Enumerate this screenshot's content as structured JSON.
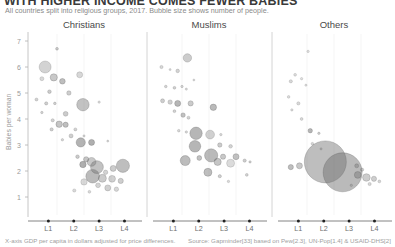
{
  "header": {
    "title": "WITH HIGHER INCOME COMES FEWER BABIES",
    "subtitle": "All countries split into religious groups, 2017. Bubble size shows number of people."
  },
  "footer": {
    "note": "X-axis GDP per capita in dollars adjusted for price differences.",
    "source": "Source: Gapminder[33] based on Pew[2.3], UN-Pop[1.4] & USAID-DHS[2]"
  },
  "axes": {
    "ylabel": "Babies per woman",
    "yticks": [
      "7",
      "6",
      "5",
      "4",
      "3",
      "2",
      "1"
    ],
    "xticks": [
      "L1",
      "L2",
      "L3",
      "L4"
    ]
  },
  "chart_data": {
    "type": "scatter",
    "title": "WITH HIGHER INCOME COMES FEWER BABIES",
    "subtitle": "All countries split into religious groups, 2017. Bubble size shows number of people.",
    "xlabel": "X-axis GDP per capita in dollars adjusted for price differences.",
    "ylabel": "Babies per woman",
    "xscale": "log",
    "xtick_labels": [
      "L1",
      "L2",
      "L3",
      "L4"
    ],
    "ytick_labels": [
      "7",
      "6",
      "5",
      "4",
      "3",
      "2",
      "1"
    ],
    "ylim": [
      0.7,
      7.4
    ],
    "grid": false,
    "legend": "none",
    "size_encoding": "bubble area = number of people",
    "panels": [
      {
        "name": "Christians",
        "points": [
          {
            "x": 0.14,
            "y": 6.0,
            "r": 6.0,
            "o": 0.3
          },
          {
            "x": 0.25,
            "y": 6.7,
            "r": 1.4,
            "o": 0.35
          },
          {
            "x": 0.22,
            "y": 5.6,
            "r": 3.6,
            "o": 0.38
          },
          {
            "x": 0.3,
            "y": 5.45,
            "r": 2.8,
            "o": 0.45
          },
          {
            "x": 0.46,
            "y": 5.7,
            "r": 3.0,
            "o": 0.28
          },
          {
            "x": 0.11,
            "y": 5.55,
            "r": 2.0,
            "o": 0.26
          },
          {
            "x": 0.18,
            "y": 5.05,
            "r": 1.8,
            "o": 0.35
          },
          {
            "x": 0.36,
            "y": 5.0,
            "r": 2.2,
            "o": 0.34
          },
          {
            "x": 0.06,
            "y": 4.75,
            "r": 1.5,
            "o": 0.3
          },
          {
            "x": 0.15,
            "y": 4.6,
            "r": 1.6,
            "o": 0.33
          },
          {
            "x": 0.23,
            "y": 4.6,
            "r": 1.3,
            "o": 0.32
          },
          {
            "x": 0.49,
            "y": 4.55,
            "r": 6.2,
            "o": 0.42
          },
          {
            "x": 0.64,
            "y": 4.65,
            "r": 1.2,
            "o": 0.25
          },
          {
            "x": 0.11,
            "y": 4.25,
            "r": 1.2,
            "o": 0.3
          },
          {
            "x": 0.33,
            "y": 4.2,
            "r": 2.4,
            "o": 0.36
          },
          {
            "x": 0.21,
            "y": 3.95,
            "r": 1.6,
            "o": 0.3
          },
          {
            "x": 0.27,
            "y": 3.8,
            "r": 3.2,
            "o": 0.4
          },
          {
            "x": 0.33,
            "y": 3.78,
            "r": 2.6,
            "o": 0.44
          },
          {
            "x": 0.2,
            "y": 3.6,
            "r": 1.6,
            "o": 0.32
          },
          {
            "x": 0.42,
            "y": 3.6,
            "r": 1.5,
            "o": 0.3
          },
          {
            "x": 0.38,
            "y": 3.35,
            "r": 2.0,
            "o": 0.33
          },
          {
            "x": 0.3,
            "y": 3.2,
            "r": 1.2,
            "o": 0.28
          },
          {
            "x": 0.5,
            "y": 3.35,
            "r": 1.1,
            "o": 0.26
          },
          {
            "x": 0.47,
            "y": 3.1,
            "r": 4.6,
            "o": 0.52
          },
          {
            "x": 0.57,
            "y": 3.1,
            "r": 3.0,
            "o": 0.55
          },
          {
            "x": 0.72,
            "y": 3.15,
            "r": 1.0,
            "o": 0.28
          },
          {
            "x": 0.44,
            "y": 2.55,
            "r": 1.8,
            "o": 0.36
          },
          {
            "x": 0.52,
            "y": 2.45,
            "r": 2.6,
            "o": 0.4
          },
          {
            "x": 0.57,
            "y": 2.35,
            "r": 4.4,
            "o": 0.38
          },
          {
            "x": 0.49,
            "y": 2.25,
            "r": 3.2,
            "o": 0.55
          },
          {
            "x": 0.62,
            "y": 2.15,
            "r": 6.4,
            "o": 0.42
          },
          {
            "x": 0.86,
            "y": 2.2,
            "r": 6.6,
            "o": 0.45
          },
          {
            "x": 0.77,
            "y": 2.1,
            "r": 3.0,
            "o": 0.35
          },
          {
            "x": 0.7,
            "y": 1.95,
            "r": 2.2,
            "o": 0.3
          },
          {
            "x": 0.58,
            "y": 1.8,
            "r": 6.8,
            "o": 0.48
          },
          {
            "x": 0.67,
            "y": 1.72,
            "r": 4.0,
            "o": 0.36
          },
          {
            "x": 0.76,
            "y": 1.7,
            "r": 3.4,
            "o": 0.32
          },
          {
            "x": 0.84,
            "y": 1.62,
            "r": 2.6,
            "o": 0.34
          },
          {
            "x": 0.5,
            "y": 1.58,
            "r": 3.2,
            "o": 0.26
          },
          {
            "x": 0.63,
            "y": 1.45,
            "r": 2.4,
            "o": 0.3
          },
          {
            "x": 0.72,
            "y": 1.35,
            "r": 3.0,
            "o": 0.32
          },
          {
            "x": 0.8,
            "y": 1.3,
            "r": 2.2,
            "o": 0.28
          },
          {
            "x": 0.41,
            "y": 1.25,
            "r": 1.6,
            "o": 0.26
          },
          {
            "x": 0.55,
            "y": 1.2,
            "r": 1.4,
            "o": 0.26
          }
        ]
      },
      {
        "name": "Muslims",
        "points": [
          {
            "x": 0.3,
            "y": 6.35,
            "r": 4.2,
            "o": 0.35
          },
          {
            "x": 0.06,
            "y": 6.0,
            "r": 1.6,
            "o": 0.28
          },
          {
            "x": 0.21,
            "y": 5.85,
            "r": 1.8,
            "o": 0.3
          },
          {
            "x": 0.14,
            "y": 5.9,
            "r": 1.0,
            "o": 0.26
          },
          {
            "x": 0.36,
            "y": 5.5,
            "r": 1.0,
            "o": 0.25
          },
          {
            "x": 0.1,
            "y": 5.25,
            "r": 1.3,
            "o": 0.3
          },
          {
            "x": 0.18,
            "y": 5.2,
            "r": 1.4,
            "o": 0.32
          },
          {
            "x": 0.25,
            "y": 5.25,
            "r": 1.2,
            "o": 0.28
          },
          {
            "x": 0.29,
            "y": 5.15,
            "r": 1.1,
            "o": 0.27
          },
          {
            "x": 0.07,
            "y": 4.7,
            "r": 2.0,
            "o": 0.34
          },
          {
            "x": 0.14,
            "y": 4.65,
            "r": 2.2,
            "o": 0.32
          },
          {
            "x": 0.21,
            "y": 4.6,
            "r": 3.0,
            "o": 0.5
          },
          {
            "x": 0.33,
            "y": 4.6,
            "r": 2.6,
            "o": 0.36
          },
          {
            "x": 0.54,
            "y": 4.45,
            "r": 3.2,
            "o": 0.48
          },
          {
            "x": 0.18,
            "y": 4.3,
            "r": 1.4,
            "o": 0.3
          },
          {
            "x": 0.26,
            "y": 4.15,
            "r": 2.2,
            "o": 0.42
          },
          {
            "x": 0.31,
            "y": 4.05,
            "r": 1.5,
            "o": 0.3
          },
          {
            "x": 0.22,
            "y": 3.55,
            "r": 1.3,
            "o": 0.28
          },
          {
            "x": 0.29,
            "y": 3.5,
            "r": 1.2,
            "o": 0.27
          },
          {
            "x": 0.38,
            "y": 3.45,
            "r": 6.2,
            "o": 0.5
          },
          {
            "x": 0.51,
            "y": 3.4,
            "r": 4.4,
            "o": 0.32
          },
          {
            "x": 0.61,
            "y": 3.4,
            "r": 1.2,
            "o": 0.28
          },
          {
            "x": 0.37,
            "y": 2.95,
            "r": 5.8,
            "o": 0.5
          },
          {
            "x": 0.6,
            "y": 3.0,
            "r": 2.2,
            "o": 0.35
          },
          {
            "x": 0.7,
            "y": 2.95,
            "r": 1.8,
            "o": 0.3
          },
          {
            "x": 0.52,
            "y": 2.6,
            "r": 6.6,
            "o": 0.48
          },
          {
            "x": 0.41,
            "y": 2.5,
            "r": 2.4,
            "o": 0.42
          },
          {
            "x": 0.63,
            "y": 2.55,
            "r": 2.6,
            "o": 0.38
          },
          {
            "x": 0.75,
            "y": 2.55,
            "r": 3.0,
            "o": 0.42
          },
          {
            "x": 0.28,
            "y": 2.4,
            "r": 5.0,
            "o": 0.46
          },
          {
            "x": 0.58,
            "y": 2.35,
            "r": 3.6,
            "o": 0.4
          },
          {
            "x": 0.7,
            "y": 2.3,
            "r": 4.0,
            "o": 0.25
          },
          {
            "x": 0.83,
            "y": 2.4,
            "r": 1.6,
            "o": 0.34
          },
          {
            "x": 0.88,
            "y": 2.35,
            "r": 1.2,
            "o": 0.3
          },
          {
            "x": 0.49,
            "y": 1.95,
            "r": 4.0,
            "o": 0.45
          },
          {
            "x": 0.6,
            "y": 1.8,
            "r": 1.6,
            "o": 0.32
          },
          {
            "x": 0.85,
            "y": 1.85,
            "r": 1.4,
            "o": 0.3
          },
          {
            "x": 0.68,
            "y": 1.6,
            "r": 1.2,
            "o": 0.26
          }
        ]
      },
      {
        "name": "Others",
        "points": [
          {
            "x": 0.26,
            "y": 6.6,
            "r": 1.2,
            "o": 0.22
          },
          {
            "x": 0.14,
            "y": 5.7,
            "r": 1.4,
            "o": 0.24
          },
          {
            "x": 0.2,
            "y": 5.55,
            "r": 1.2,
            "o": 0.22
          },
          {
            "x": 0.1,
            "y": 5.45,
            "r": 1.6,
            "o": 0.26
          },
          {
            "x": 0.24,
            "y": 5.3,
            "r": 1.1,
            "o": 0.22
          },
          {
            "x": 0.08,
            "y": 4.85,
            "r": 1.3,
            "o": 0.24
          },
          {
            "x": 0.17,
            "y": 4.6,
            "r": 1.6,
            "o": 0.26
          },
          {
            "x": 0.11,
            "y": 4.35,
            "r": 1.2,
            "o": 0.24
          },
          {
            "x": 0.2,
            "y": 4.0,
            "r": 1.4,
            "o": 0.26
          },
          {
            "x": 0.28,
            "y": 3.55,
            "r": 2.2,
            "o": 0.5
          },
          {
            "x": 0.36,
            "y": 3.45,
            "r": 1.2,
            "o": 0.32
          },
          {
            "x": 0.3,
            "y": 3.05,
            "r": 1.3,
            "o": 0.28
          },
          {
            "x": 0.38,
            "y": 2.85,
            "r": 1.1,
            "o": 0.26
          },
          {
            "x": 0.42,
            "y": 2.35,
            "r": 21.0,
            "o": 0.45
          },
          {
            "x": 0.58,
            "y": 1.95,
            "r": 19.5,
            "o": 0.48
          },
          {
            "x": 0.1,
            "y": 2.15,
            "r": 2.6,
            "o": 0.45
          },
          {
            "x": 0.18,
            "y": 2.2,
            "r": 3.0,
            "o": 0.38
          },
          {
            "x": 0.71,
            "y": 2.2,
            "r": 2.0,
            "o": 0.38
          },
          {
            "x": 0.76,
            "y": 2.05,
            "r": 1.6,
            "o": 0.32
          },
          {
            "x": 0.72,
            "y": 1.85,
            "r": 3.4,
            "o": 0.4
          },
          {
            "x": 0.8,
            "y": 1.75,
            "r": 3.8,
            "o": 0.35
          },
          {
            "x": 0.87,
            "y": 1.7,
            "r": 2.6,
            "o": 0.34
          },
          {
            "x": 0.92,
            "y": 1.6,
            "r": 1.4,
            "o": 0.28
          },
          {
            "x": 0.83,
            "y": 1.5,
            "r": 1.6,
            "o": 0.28
          },
          {
            "x": 0.66,
            "y": 1.45,
            "r": 1.2,
            "o": 0.26
          }
        ]
      }
    ]
  }
}
